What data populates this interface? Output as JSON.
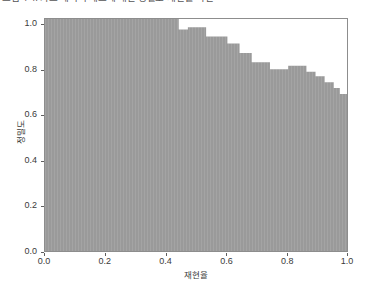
{
  "caption": {
    "text": "그림 4-4. 카드 데이터 세트에 대한 정밀도-재현율 곡선"
  },
  "chart": {
    "xaxis_title": "재현율",
    "yaxis_title": "정밀도",
    "fill_color": "#9a9a9a",
    "frame_color": "#8d8d8d",
    "tick_color": "#5e5e5e"
  },
  "chart_data": {
    "type": "area",
    "title": "",
    "subtitle": "",
    "xlabel": "재현율",
    "ylabel": "정밀도",
    "xlim": [
      0.0,
      1.0
    ],
    "ylim": [
      0.0,
      1.0
    ],
    "grid": false,
    "legend": null,
    "xticks": [
      0.0,
      0.2,
      0.4,
      0.6,
      0.8,
      1.0
    ],
    "xtick_labels": [
      "0.0",
      "0.2",
      "0.4",
      "0.6",
      "0.8",
      "1.0"
    ],
    "yticks": [
      0.0,
      0.2,
      0.4,
      0.6,
      0.8,
      1.0
    ],
    "ytick_labels": [
      "0.0",
      "0.2",
      "0.4",
      "0.6",
      "0.8",
      "1.0"
    ],
    "step_style": "post",
    "series": [
      {
        "name": "정밀도-재현율 곡선",
        "color": "#9a9a9a",
        "x": [
          0.0,
          0.41,
          0.44,
          0.47,
          0.5,
          0.53,
          0.56,
          0.6,
          0.64,
          0.68,
          0.71,
          0.74,
          0.77,
          0.8,
          0.83,
          0.86,
          0.89,
          0.92,
          0.95,
          0.97,
          1.0
        ],
        "y": [
          1.0,
          1.0,
          0.955,
          0.965,
          0.965,
          0.925,
          0.925,
          0.895,
          0.855,
          0.815,
          0.815,
          0.785,
          0.785,
          0.8,
          0.8,
          0.775,
          0.755,
          0.73,
          0.705,
          0.68,
          0.62
        ]
      }
    ]
  }
}
